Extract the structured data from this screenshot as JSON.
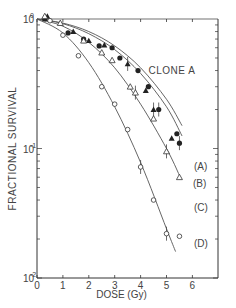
{
  "chart_data": {
    "type": "scatter",
    "title": "CLONE A",
    "xlabel": "DOSE (Gy)",
    "ylabel": "FRACTIONAL SURVIVAL",
    "xlim": [
      0,
      7
    ],
    "ylim": [
      0.01,
      1
    ],
    "yscale": "log",
    "xticks": [
      "0",
      "1",
      "2",
      "3",
      "4",
      "5",
      "6"
    ],
    "yticks": [
      "10^0",
      "10^-1",
      "10^-2"
    ],
    "grid": false,
    "legend": "curve labels at right end of each curve",
    "series": [
      {
        "name": "(A)",
        "marker": "filled-circle",
        "points": [
          [
            0.3,
            1.0
          ],
          [
            1.2,
            0.78
          ],
          [
            1.8,
            0.7
          ],
          [
            2.4,
            0.62
          ],
          [
            2.9,
            0.6
          ],
          [
            3.2,
            0.5
          ],
          [
            3.9,
            0.4
          ],
          [
            4.3,
            0.3
          ],
          [
            4.7,
            0.2
          ],
          [
            5.4,
            0.13
          ],
          [
            5.5,
            0.11
          ]
        ],
        "fit": [
          [
            0,
            1.0
          ],
          [
            1,
            0.93
          ],
          [
            2,
            0.8
          ],
          [
            3,
            0.62
          ],
          [
            4,
            0.42
          ],
          [
            5,
            0.24
          ],
          [
            5.6,
            0.15
          ]
        ]
      },
      {
        "name": "(B)",
        "marker": "filled-triangle",
        "points": [
          [
            0.4,
            1.05
          ],
          [
            1.4,
            0.8
          ],
          [
            2.0,
            0.68
          ],
          [
            2.6,
            0.63
          ],
          [
            3.5,
            0.45
          ],
          [
            4.2,
            0.28
          ],
          [
            4.5,
            0.2
          ],
          [
            5.2,
            0.12
          ]
        ],
        "fit": [
          [
            0,
            1.0
          ],
          [
            1,
            0.92
          ],
          [
            2,
            0.77
          ],
          [
            3,
            0.58
          ],
          [
            4,
            0.38
          ],
          [
            5,
            0.21
          ],
          [
            5.6,
            0.125
          ]
        ]
      },
      {
        "name": "(C)",
        "marker": "open-triangle",
        "points": [
          [
            0.3,
            1.05
          ],
          [
            0.9,
            0.93
          ],
          [
            1.8,
            0.68
          ],
          [
            2.5,
            0.55
          ],
          [
            2.9,
            0.48
          ],
          [
            3.6,
            0.3
          ],
          [
            3.8,
            0.27
          ],
          [
            4.5,
            0.17
          ],
          [
            5.0,
            0.095
          ],
          [
            5.5,
            0.06
          ]
        ],
        "fit": [
          [
            0,
            1.0
          ],
          [
            1,
            0.88
          ],
          [
            2,
            0.66
          ],
          [
            3,
            0.42
          ],
          [
            4,
            0.22
          ],
          [
            5,
            0.1
          ],
          [
            5.5,
            0.062
          ]
        ]
      },
      {
        "name": "(D)",
        "marker": "open-circle",
        "points": [
          [
            0.5,
            0.97
          ],
          [
            1.0,
            0.75
          ],
          [
            1.6,
            0.52
          ],
          [
            2.5,
            0.3
          ],
          [
            3.0,
            0.22
          ],
          [
            3.5,
            0.14
          ],
          [
            4.0,
            0.072
          ],
          [
            4.5,
            0.04
          ],
          [
            5.0,
            0.022
          ],
          [
            5.5,
            0.021
          ]
        ],
        "fit": [
          [
            0,
            1.0
          ],
          [
            1,
            0.78
          ],
          [
            2,
            0.46
          ],
          [
            3,
            0.21
          ],
          [
            4,
            0.078
          ],
          [
            5,
            0.024
          ],
          [
            5.35,
            0.016
          ]
        ]
      }
    ]
  }
}
